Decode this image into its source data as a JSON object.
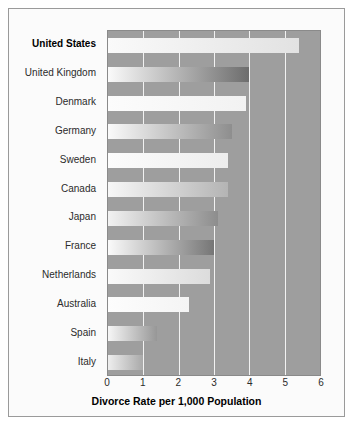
{
  "chart_data": {
    "type": "bar",
    "orientation": "horizontal",
    "title": "",
    "xlabel": "Divorce Rate per 1,000 Population",
    "ylabel": "",
    "xlim": [
      0,
      6
    ],
    "xticks": [
      0,
      1,
      2,
      3,
      4,
      5,
      6
    ],
    "xtick_labels": [
      "0",
      "1",
      "2",
      "3",
      "4",
      "5",
      "6"
    ],
    "grid": "vertical white gridlines at each unit",
    "legend": "none",
    "plot_background": "#9e9e9e",
    "bar_style": "left-to-right light-to-dark gray gradient",
    "highlighted_category": "United States",
    "categories": [
      "United States",
      "United Kingdom",
      "Denmark",
      "Germany",
      "Sweden",
      "Canada",
      "Japan",
      "France",
      "Netherlands",
      "Australia",
      "Spain",
      "Italy"
    ],
    "values": [
      5.4,
      4.0,
      3.9,
      3.5,
      3.4,
      3.4,
      3.1,
      3.0,
      2.9,
      2.3,
      1.4,
      1.0
    ],
    "bars": [
      {
        "label": "United States",
        "value": 5.4,
        "bold": true,
        "from": "#fafafa",
        "to": "#e2e2e2"
      },
      {
        "label": "United Kingdom",
        "value": 4.0,
        "bold": false,
        "from": "#fafafa",
        "to": "#6d6d6d"
      },
      {
        "label": "Denmark",
        "value": 3.9,
        "bold": false,
        "from": "#fcfcfc",
        "to": "#f2f2f2"
      },
      {
        "label": "Germany",
        "value": 3.5,
        "bold": false,
        "from": "#fafafa",
        "to": "#8e8e8e"
      },
      {
        "label": "Sweden",
        "value": 3.4,
        "bold": false,
        "from": "#fcfcfc",
        "to": "#ededed"
      },
      {
        "label": "Canada",
        "value": 3.4,
        "bold": false,
        "from": "#f7f7f7",
        "to": "#b4b4b4"
      },
      {
        "label": "Japan",
        "value": 3.1,
        "bold": false,
        "from": "#f2f2f2",
        "to": "#8d8d8d"
      },
      {
        "label": "France",
        "value": 3.0,
        "bold": false,
        "from": "#fafafa",
        "to": "#767676"
      },
      {
        "label": "Netherlands",
        "value": 2.9,
        "bold": false,
        "from": "#fafafa",
        "to": "#dcdcdc"
      },
      {
        "label": "Australia",
        "value": 2.3,
        "bold": false,
        "from": "#fdfdfd",
        "to": "#f4f4f4"
      },
      {
        "label": "Spain",
        "value": 1.4,
        "bold": false,
        "from": "#f6f6f6",
        "to": "#979797"
      },
      {
        "label": "Italy",
        "value": 1.0,
        "bold": false,
        "from": "#eeeeee",
        "to": "#a9a9a9"
      }
    ]
  }
}
